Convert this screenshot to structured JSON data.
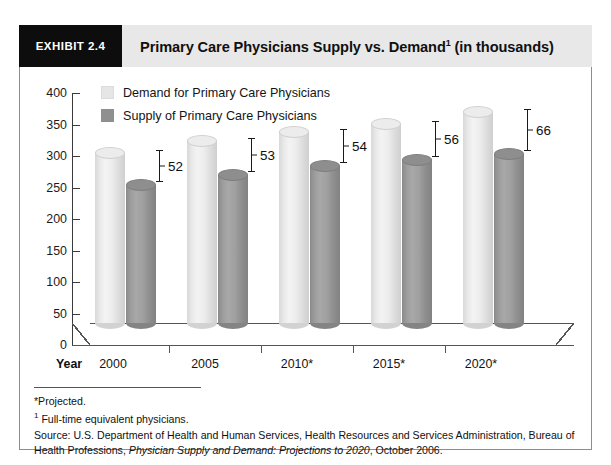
{
  "exhibit": {
    "tag": "EXHIBIT 2.4",
    "title_main": "Primary Care Physicians Supply vs. Demand",
    "title_sup": "1",
    "title_tail": " (in thousands)"
  },
  "chart_data": {
    "type": "bar",
    "xlabel": "Year",
    "ylabel": "",
    "categories": [
      "2000",
      "2005",
      "2010*",
      "2015*",
      "2020*"
    ],
    "series": [
      {
        "name": "Demand for Primary Care Physicians",
        "color": "#e6e6e6",
        "values": [
          280,
          298,
          313,
          325,
          344
        ]
      },
      {
        "name": "Supply of Primary Care Physicians",
        "color": "#8f8f8f",
        "values": [
          228,
          245,
          259,
          269,
          278
        ]
      }
    ],
    "gap_labels": [
      "52",
      "53",
      "54",
      "56",
      "66"
    ],
    "ylim": [
      0,
      400
    ],
    "yticks": [
      "0",
      "50",
      "100",
      "150",
      "200",
      "250",
      "300",
      "350",
      "400"
    ],
    "grid": false,
    "legend_position": "top-left",
    "style": "3d-cylinder"
  },
  "axis": {
    "year_title": "Year",
    "ticks": [
      "400",
      "350",
      "300",
      "250",
      "200",
      "150",
      "100",
      "50",
      "0"
    ]
  },
  "legend": {
    "items": [
      {
        "label": "Demand for Primary Care Physicians",
        "key": "demand"
      },
      {
        "label": "Supply of Primary Care Physicians",
        "key": "supply"
      }
    ]
  },
  "notes": {
    "projected": "*Projected.",
    "fte_sup": "1",
    "fte": " Full-time equivalent physicians.",
    "source_pre": "Source: U.S. Department of Health and Human Services, Health Resources and Services Administration, Bureau of Health Professions, ",
    "source_italic": "Physician Supply and Demand: Projections to 2020",
    "source_post": ", October 2006."
  }
}
